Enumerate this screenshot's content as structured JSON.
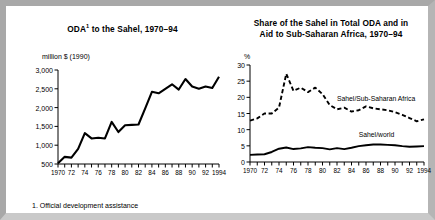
{
  "figure": {
    "footnote": "1. Official development assistance",
    "frame_color": "#a8a8a8",
    "background_color": "#ffffff",
    "ink_color": "#000000"
  },
  "chart_data": [
    {
      "id": "oda-to-sahel",
      "type": "line",
      "title": "ODA",
      "title_superscript": "1",
      "title_rest": " to the Sahel, 1970–94",
      "title_full": "ODA¹ to the Sahel, 1970–94",
      "ylabel": "million $ (1990)",
      "xlabel": "",
      "ylim": [
        500,
        3000
      ],
      "xlim": [
        1970,
        1994
      ],
      "grid": false,
      "legend": "none",
      "yticks": [
        500,
        1000,
        1500,
        2000,
        2500,
        3000
      ],
      "ytick_labels": [
        "500",
        "1,000",
        "1,500",
        "2,000",
        "2,500",
        "3,000"
      ],
      "xticks": [
        1970,
        1971,
        1972,
        1973,
        1974,
        1975,
        1976,
        1977,
        1978,
        1979,
        1980,
        1981,
        1982,
        1983,
        1984,
        1985,
        1986,
        1987,
        1988,
        1989,
        1990,
        1991,
        1992,
        1993,
        1994
      ],
      "xtick_labels": [
        {
          "x": 1970,
          "label": "1970"
        },
        {
          "x": 1972,
          "label": "72"
        },
        {
          "x": 1974,
          "label": "74"
        },
        {
          "x": 1976,
          "label": "76"
        },
        {
          "x": 1978,
          "label": "78"
        },
        {
          "x": 1980,
          "label": "80"
        },
        {
          "x": 1982,
          "label": "82"
        },
        {
          "x": 1984,
          "label": "84"
        },
        {
          "x": 1986,
          "label": "86"
        },
        {
          "x": 1988,
          "label": "88"
        },
        {
          "x": 1990,
          "label": "90"
        },
        {
          "x": 1992,
          "label": "92"
        },
        {
          "x": 1994,
          "label": "1994"
        }
      ],
      "series": [
        {
          "name": "ODA to the Sahel",
          "style": "solid",
          "x": [
            1970,
            1971,
            1972,
            1973,
            1974,
            1975,
            1976,
            1977,
            1978,
            1979,
            1980,
            1981,
            1982,
            1983,
            1984,
            1985,
            1986,
            1987,
            1988,
            1989,
            1990,
            1991,
            1992,
            1993,
            1994
          ],
          "values": [
            520,
            690,
            670,
            900,
            1320,
            1180,
            1200,
            1180,
            1620,
            1350,
            1530,
            1540,
            1550,
            1980,
            2420,
            2380,
            2500,
            2620,
            2480,
            2760,
            2560,
            2500,
            2560,
            2520,
            2820
          ]
        }
      ]
    },
    {
      "id": "share-of-sahel",
      "type": "line",
      "title_full": "Share of the Sahel in Total ODA and in Aid to Sub-Saharan Africa, 1970–94",
      "title_line1": "Share of the Sahel in Total ODA and in",
      "title_line2": "Aid to Sub-Saharan Africa, 1970–94",
      "ylabel": "%",
      "xlabel": "",
      "ylim": [
        0,
        30
      ],
      "xlim": [
        1970,
        1994
      ],
      "grid": false,
      "legend": "inline-annotations",
      "yticks": [
        0,
        5,
        10,
        15,
        20,
        25,
        30
      ],
      "ytick_labels": [
        "0",
        "5",
        "10",
        "15",
        "20",
        "25",
        "30"
      ],
      "xtick_labels": [
        {
          "x": 1970,
          "label": "1970"
        },
        {
          "x": 1972,
          "label": "72"
        },
        {
          "x": 1974,
          "label": "74"
        },
        {
          "x": 1976,
          "label": "76"
        },
        {
          "x": 1978,
          "label": "78"
        },
        {
          "x": 1980,
          "label": "80"
        },
        {
          "x": 1982,
          "label": "82"
        },
        {
          "x": 1984,
          "label": "84"
        },
        {
          "x": 1986,
          "label": "86"
        },
        {
          "x": 1988,
          "label": "88"
        },
        {
          "x": 1990,
          "label": "90"
        },
        {
          "x": 1992,
          "label": "92"
        },
        {
          "x": 1994,
          "label": "1994"
        }
      ],
      "series": [
        {
          "name": "Sahel/Sub-Saharan Africa",
          "style": "dashed",
          "x": [
            1970,
            1971,
            1972,
            1973,
            1974,
            1975,
            1976,
            1977,
            1978,
            1979,
            1980,
            1981,
            1982,
            1983,
            1984,
            1985,
            1986,
            1987,
            1988,
            1989,
            1990,
            1991,
            1992,
            1993,
            1994
          ],
          "values": [
            12.8,
            13.5,
            15.0,
            15.0,
            16.8,
            27.3,
            22.0,
            23.0,
            21.6,
            23.0,
            21.0,
            17.6,
            16.3,
            16.8,
            15.6,
            16.0,
            17.2,
            16.6,
            16.3,
            16.0,
            15.4,
            14.6,
            13.6,
            12.6,
            13.2
          ]
        },
        {
          "name": "Sahel/world",
          "style": "solid",
          "x": [
            1970,
            1971,
            1972,
            1973,
            1974,
            1975,
            1976,
            1977,
            1978,
            1979,
            1980,
            1981,
            1982,
            1983,
            1984,
            1985,
            1986,
            1987,
            1988,
            1989,
            1990,
            1991,
            1992,
            1993,
            1994
          ],
          "values": [
            2.2,
            2.3,
            2.4,
            3.1,
            4.1,
            4.5,
            4.0,
            4.2,
            4.6,
            4.4,
            4.3,
            3.9,
            4.3,
            4.0,
            4.4,
            4.9,
            5.2,
            5.4,
            5.4,
            5.3,
            5.2,
            4.9,
            4.7,
            4.8,
            4.9
          ]
        }
      ],
      "annotations": [
        {
          "text": "Sahel/Sub-Saharan Africa",
          "x": 1982,
          "y": 19.5
        },
        {
          "text": "Sahel/world",
          "x": 1985,
          "y": 8.2
        }
      ]
    }
  ]
}
